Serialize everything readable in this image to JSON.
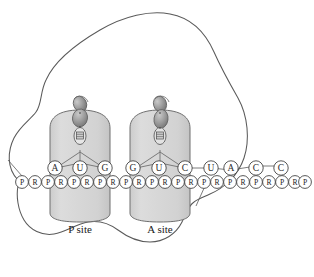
{
  "figure": {
    "type": "biology-diagram"
  },
  "colors": {
    "outline": "#555555",
    "trna_fill": "#d4d4d4",
    "trna_stroke": "#6b6b6b",
    "aminoacid_fill": "#9a9a9a",
    "aminoacid_stroke": "#5a5a5a",
    "circle_fill": "#ffffff",
    "circle_stroke": "#3a3a3a",
    "text": "#1a1a1a",
    "background": "#ffffff"
  },
  "ribosome": {
    "name": "ribosome-outline"
  },
  "sites": [
    {
      "id": "p-site",
      "label": "P site",
      "cx": 80,
      "anticodon": [
        "A",
        "U",
        "G"
      ]
    },
    {
      "id": "a-site",
      "label": "A site",
      "cx": 160,
      "anticodon": [
        "G",
        "U",
        "C"
      ]
    }
  ],
  "mrna": {
    "bases": [
      {
        "letter": "A",
        "x": 55
      },
      {
        "letter": "U",
        "x": 80
      },
      {
        "letter": "G",
        "x": 105
      },
      {
        "letter": "G",
        "x": 133
      },
      {
        "letter": "U",
        "x": 159
      },
      {
        "letter": "C",
        "x": 185
      },
      {
        "letter": "U",
        "x": 211
      },
      {
        "letter": "A",
        "x": 231
      },
      {
        "letter": "C",
        "x": 256
      },
      {
        "letter": "C",
        "x": 281
      }
    ],
    "backbone": [
      {
        "letter": "P",
        "x": 22
      },
      {
        "letter": "R",
        "x": 35
      },
      {
        "letter": "P",
        "x": 48
      },
      {
        "letter": "R",
        "x": 61
      },
      {
        "letter": "P",
        "x": 74
      },
      {
        "letter": "R",
        "x": 87
      },
      {
        "letter": "P",
        "x": 100
      },
      {
        "letter": "R",
        "x": 113
      },
      {
        "letter": "P",
        "x": 126
      },
      {
        "letter": "R",
        "x": 139
      },
      {
        "letter": "P",
        "x": 152
      },
      {
        "letter": "R",
        "x": 165
      },
      {
        "letter": "P",
        "x": 178
      },
      {
        "letter": "R",
        "x": 191
      },
      {
        "letter": "P",
        "x": 204
      },
      {
        "letter": "R",
        "x": 217
      },
      {
        "letter": "P",
        "x": 230
      },
      {
        "letter": "R",
        "x": 243
      },
      {
        "letter": "P",
        "x": 256
      },
      {
        "letter": "R",
        "x": 269
      },
      {
        "letter": "P",
        "x": 282
      },
      {
        "letter": "R",
        "x": 295
      },
      {
        "letter": "P",
        "x": 305
      }
    ]
  }
}
